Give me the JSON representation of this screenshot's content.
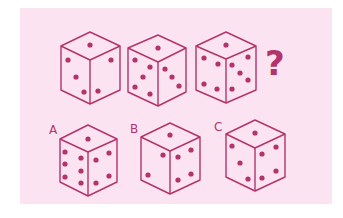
{
  "puzzle": {
    "background_color": "#fbe3f1",
    "ink_color": "#b3336b",
    "question_mark": "?",
    "sequence": [
      {
        "id": "die-1",
        "top": 1,
        "left": 3,
        "right": 2
      },
      {
        "id": "die-2",
        "top": 1,
        "left": 5,
        "right": 3
      },
      {
        "id": "die-3",
        "top": 1,
        "left": 5,
        "right": 5
      }
    ],
    "options": [
      {
        "label": "A",
        "top": 1,
        "left": 9,
        "right": 5
      },
      {
        "label": "B",
        "top": 1,
        "left": 2,
        "right": 5
      },
      {
        "label": "C",
        "top": 1,
        "left": 4,
        "right": 5
      }
    ]
  }
}
